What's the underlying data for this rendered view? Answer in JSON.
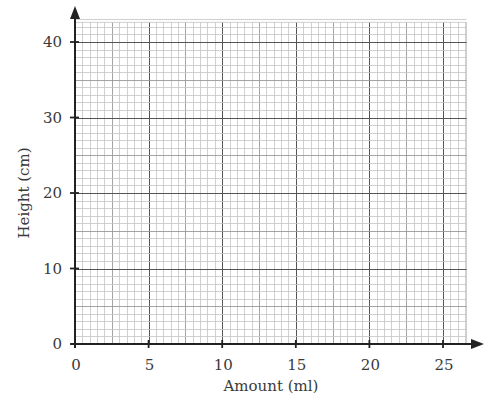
{
  "chart_data": {
    "type": "scatter",
    "title": "",
    "xlabel": "Amount (ml)",
    "ylabel": "Height (cm)",
    "xlim": [
      0,
      26.6
    ],
    "ylim": [
      0,
      42.6
    ],
    "x_ticks": [
      0,
      5,
      10,
      15,
      20,
      25
    ],
    "y_ticks": [
      0,
      10,
      20,
      30,
      40
    ],
    "x_tick_labels": [
      "0",
      "5",
      "10",
      "15",
      "20",
      "25"
    ],
    "y_tick_labels": [
      "0",
      "10",
      "20",
      "30",
      "40"
    ],
    "grid": {
      "on": true,
      "style": "graph-paper",
      "x_minor_step": 0.5,
      "x_medium_step": 2.5,
      "x_major_step": 5,
      "y_minor_step": 1,
      "y_medium_step": 5,
      "y_major_step": 10
    },
    "series": [],
    "legend": null,
    "note": "Blank graph paper with no plotted data"
  },
  "colors": {
    "axis": "#222222",
    "grid_minor": "#c4c4c4",
    "grid_medium": "#9a9a9a",
    "grid_major": "#555555",
    "text": "#3a3a3a"
  }
}
